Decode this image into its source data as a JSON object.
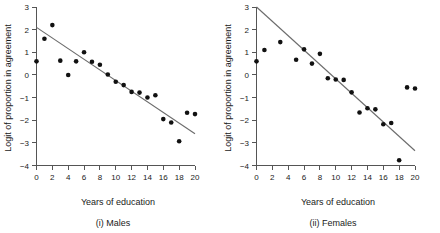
{
  "figure": {
    "panels": [
      {
        "id": "males",
        "caption": "(i) Males",
        "xlabel": "Years of education",
        "ylabel": "Logit of proportion in agreement"
      },
      {
        "id": "females",
        "caption": "(ii) Females",
        "xlabel": "Years of education",
        "ylabel": "Logit of proportion in agreement"
      }
    ]
  },
  "chart_data": [
    {
      "type": "scatter",
      "title": "(i) Males",
      "xlabel": "Years of education",
      "ylabel": "Logit of proportion in agreement",
      "xlim": [
        0,
        20
      ],
      "ylim": [
        -4,
        3
      ],
      "xticks": [
        0,
        2,
        4,
        6,
        8,
        10,
        12,
        14,
        16,
        18,
        20
      ],
      "yticks": [
        3,
        2,
        1,
        0,
        -1,
        -2,
        -3,
        -4
      ],
      "xticklabels": [
        "0",
        "2",
        "4",
        "6",
        "8",
        "10",
        "12",
        "14",
        "16",
        "18",
        "20"
      ],
      "yticklabels": [
        "3",
        "2",
        "1",
        "0",
        "-1",
        "-2",
        "-3",
        "-4"
      ],
      "grid": false,
      "legend": false,
      "series": [
        {
          "name": "Observed logits",
          "marker": "filled-circle",
          "color": "#111111",
          "points": [
            {
              "x": 0,
              "y": 0.6
            },
            {
              "x": 1,
              "y": 1.6
            },
            {
              "x": 2,
              "y": 2.2
            },
            {
              "x": 3,
              "y": 0.63
            },
            {
              "x": 4,
              "y": 0.0
            },
            {
              "x": 5,
              "y": 0.6
            },
            {
              "x": 6,
              "y": 1.0
            },
            {
              "x": 7,
              "y": 0.58
            },
            {
              "x": 8,
              "y": 0.45
            },
            {
              "x": 9,
              "y": 0.02
            },
            {
              "x": 10,
              "y": -0.3
            },
            {
              "x": 11,
              "y": -0.45
            },
            {
              "x": 12,
              "y": -0.75
            },
            {
              "x": 13,
              "y": -0.78
            },
            {
              "x": 14,
              "y": -1.0
            },
            {
              "x": 15,
              "y": -0.9
            },
            {
              "x": 16,
              "y": -1.95
            },
            {
              "x": 17,
              "y": -2.1
            },
            {
              "x": 18,
              "y": -2.93
            },
            {
              "x": 19,
              "y": -1.67
            },
            {
              "x": 20,
              "y": -1.73
            }
          ]
        }
      ],
      "fit_line": {
        "name": "Fitted logistic regression line",
        "color": "#6b6b6b",
        "x0": 0,
        "y0": 2.1,
        "x1": 20,
        "y1": -2.6
      }
    },
    {
      "type": "scatter",
      "title": "(ii) Females",
      "xlabel": "Years of education",
      "ylabel": "Logit of proportion in agreement",
      "xlim": [
        0,
        20
      ],
      "ylim": [
        -4,
        3
      ],
      "xticks": [
        0,
        2,
        4,
        6,
        8,
        10,
        12,
        14,
        16,
        18,
        20
      ],
      "yticks": [
        3,
        2,
        1,
        0,
        -1,
        -2,
        -3,
        -4
      ],
      "xticklabels": [
        "0",
        "2",
        "4",
        "6",
        "8",
        "10",
        "12",
        "14",
        "16",
        "18",
        "20"
      ],
      "yticklabels": [
        "3",
        "2",
        "1",
        "0",
        "-1",
        "-2",
        "-3",
        "-4"
      ],
      "grid": false,
      "legend": false,
      "series": [
        {
          "name": "Observed logits",
          "marker": "filled-circle",
          "color": "#111111",
          "points": [
            {
              "x": 0,
              "y": 0.6
            },
            {
              "x": 1,
              "y": 1.1
            },
            {
              "x": 3,
              "y": 1.45
            },
            {
              "x": 5,
              "y": 0.67
            },
            {
              "x": 6,
              "y": 1.13
            },
            {
              "x": 7,
              "y": 0.5
            },
            {
              "x": 8,
              "y": 0.93
            },
            {
              "x": 9,
              "y": -0.15
            },
            {
              "x": 10,
              "y": -0.2
            },
            {
              "x": 11,
              "y": -0.22
            },
            {
              "x": 12,
              "y": -0.77
            },
            {
              "x": 13,
              "y": -1.66
            },
            {
              "x": 14,
              "y": -1.47
            },
            {
              "x": 15,
              "y": -1.52
            },
            {
              "x": 16,
              "y": -2.18
            },
            {
              "x": 17,
              "y": -2.12
            },
            {
              "x": 18,
              "y": -3.77
            },
            {
              "x": 19,
              "y": -0.55
            },
            {
              "x": 20,
              "y": -0.6
            }
          ]
        }
      ],
      "fit_line": {
        "name": "Fitted logistic regression line",
        "color": "#6b6b6b",
        "x0": 0,
        "y0": 3.0,
        "x1": 20,
        "y1": -3.35
      }
    }
  ]
}
